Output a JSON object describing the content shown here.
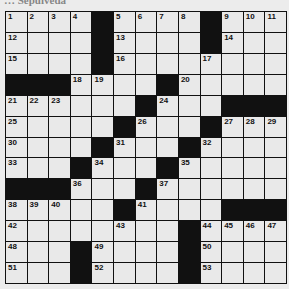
{
  "caption": "… Sepulveda",
  "grid": {
    "rows": 13,
    "cols": 13,
    "colors": {
      "black": "#111111",
      "white": "#e9e9e9",
      "background": "#ececec"
    },
    "layout": [
      [
        "1",
        "2",
        "3",
        "4",
        "#",
        "5",
        "6",
        "7",
        "8",
        "#",
        "9",
        "10",
        "11"
      ],
      [
        "12",
        "",
        "",
        "",
        "#",
        "13",
        "",
        "",
        "",
        "#",
        "14",
        "",
        ""
      ],
      [
        "15",
        "",
        "",
        "",
        "#",
        "16",
        "",
        "",
        "",
        "17",
        "",
        "",
        ""
      ],
      [
        "#",
        "#",
        "#",
        "18",
        "19",
        "",
        "",
        "#",
        "20",
        "",
        "",
        "",
        ""
      ],
      [
        "21",
        "22",
        "23",
        "",
        "",
        "",
        "#",
        "24",
        "",
        "",
        "#",
        "#",
        "#"
      ],
      [
        "25",
        "",
        "",
        "",
        "",
        "#",
        "26",
        "",
        "",
        "#",
        "27",
        "28",
        "29"
      ],
      [
        "30",
        "",
        "",
        "",
        "#",
        "31",
        "",
        "",
        "#",
        "32",
        "",
        "",
        ""
      ],
      [
        "33",
        "",
        "",
        "#",
        "34",
        "",
        "",
        "#",
        "35",
        "",
        "",
        "",
        ""
      ],
      [
        "#",
        "#",
        "#",
        "36",
        "",
        "",
        "#",
        "37",
        "",
        "",
        "",
        "",
        ""
      ],
      [
        "38",
        "39",
        "40",
        "",
        "",
        "#",
        "41",
        "",
        "",
        "",
        "#",
        "#",
        "#"
      ],
      [
        "42",
        "",
        "",
        "",
        "",
        "43",
        "",
        "",
        "#",
        "44",
        "45",
        "46",
        "47"
      ],
      [
        "48",
        "",
        "",
        "#",
        "49",
        "",
        "",
        "",
        "#",
        "50",
        "",
        "",
        ""
      ],
      [
        "51",
        "",
        "",
        "#",
        "52",
        "",
        "",
        "",
        "#",
        "53",
        "",
        "",
        ""
      ]
    ]
  }
}
